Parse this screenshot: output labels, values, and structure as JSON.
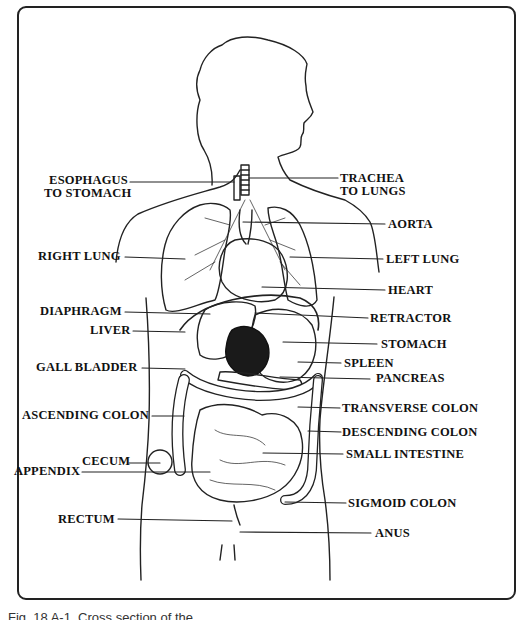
{
  "figure": {
    "caption": "Fig. 18 A-1. Cross section of the",
    "labels_left": [
      {
        "id": "esophagus",
        "line1": "ESOPHAGUS",
        "line2": "TO STOMACH"
      },
      {
        "id": "right_lung",
        "text": "RIGHT LUNG"
      },
      {
        "id": "diaphragm",
        "text": "DIAPHRAGM"
      },
      {
        "id": "liver",
        "text": "LIVER"
      },
      {
        "id": "gall_bladder",
        "text": "GALL BLADDER"
      },
      {
        "id": "ascending_colon",
        "text": "ASCENDING COLON"
      },
      {
        "id": "cecum",
        "text": "CECUM"
      },
      {
        "id": "appendix",
        "text": "APPENDIX"
      },
      {
        "id": "rectum",
        "text": "RECTUM"
      }
    ],
    "labels_right": [
      {
        "id": "trachea",
        "line1": "TRACHEA",
        "line2": "TO LUNGS"
      },
      {
        "id": "aorta",
        "text": "AORTA"
      },
      {
        "id": "left_lung",
        "text": "LEFT LUNG"
      },
      {
        "id": "heart",
        "text": "HEART"
      },
      {
        "id": "retractor",
        "text": "RETRACTOR"
      },
      {
        "id": "stomach",
        "text": "STOMACH"
      },
      {
        "id": "spleen",
        "text": "SPLEEN"
      },
      {
        "id": "pancreas",
        "text": "PANCREAS"
      },
      {
        "id": "transverse_colon",
        "text": "TRANSVERSE COLON"
      },
      {
        "id": "descending_colon",
        "text": "DESCENDING COLON"
      },
      {
        "id": "small_intestine",
        "text": "SMALL INTESTINE"
      },
      {
        "id": "sigmoid_colon",
        "text": "SIGMOID COLON"
      },
      {
        "id": "anus",
        "text": "ANUS"
      }
    ]
  }
}
